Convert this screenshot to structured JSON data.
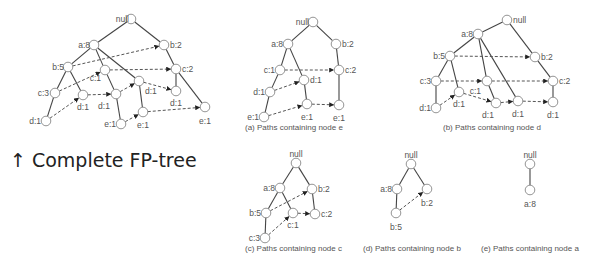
{
  "title_caption": "↑ Complete FP-tree",
  "colors": {
    "edge": "#444444",
    "link": "#555555",
    "node_stroke": "#888888",
    "text": "#555555"
  },
  "trees": [
    {
      "id": "complete",
      "caption": "",
      "nodes": [
        {
          "id": "null",
          "label": "null",
          "x": 131,
          "y": 19,
          "lx": -2,
          "ly": 0,
          "anchor": "end"
        },
        {
          "id": "a8",
          "label": "a:8",
          "x": 94,
          "y": 45,
          "lx": -4,
          "ly": 0,
          "anchor": "end"
        },
        {
          "id": "b2",
          "label": "b:2",
          "x": 164,
          "y": 45,
          "lx": 6,
          "ly": 0,
          "anchor": "start"
        },
        {
          "id": "b5",
          "label": "b:5",
          "x": 68,
          "y": 67,
          "lx": -4,
          "ly": 0,
          "anchor": "end"
        },
        {
          "id": "c1",
          "label": "c:1",
          "x": 105,
          "y": 70,
          "lx": -4,
          "ly": 8,
          "anchor": "end"
        },
        {
          "id": "c2",
          "label": "c:2",
          "x": 176,
          "y": 69,
          "lx": 6,
          "ly": 0,
          "anchor": "start"
        },
        {
          "id": "c3",
          "label": "c:3",
          "x": 55,
          "y": 93,
          "lx": -6,
          "ly": 0,
          "anchor": "end"
        },
        {
          "id": "d1a",
          "label": "d:1",
          "x": 83,
          "y": 95,
          "lx": 0,
          "ly": 12,
          "anchor": "middle"
        },
        {
          "id": "d1b",
          "label": "d:1",
          "x": 116,
          "y": 94,
          "lx": -12,
          "ly": 12,
          "anchor": "middle"
        },
        {
          "id": "d1c",
          "label": "d:1",
          "x": 139,
          "y": 81,
          "lx": 6,
          "ly": 10,
          "anchor": "start"
        },
        {
          "id": "d1d",
          "label": "d:1",
          "x": 176,
          "y": 91,
          "lx": 0,
          "ly": 12,
          "anchor": "middle"
        },
        {
          "id": "d1e",
          "label": "d:1",
          "x": 46,
          "y": 121,
          "lx": -5,
          "ly": 0,
          "anchor": "end"
        },
        {
          "id": "e1a",
          "label": "e:1",
          "x": 121,
          "y": 124,
          "lx": -5,
          "ly": 0,
          "anchor": "end"
        },
        {
          "id": "e1b",
          "label": "e:1",
          "x": 143,
          "y": 112,
          "lx": 0,
          "ly": 13,
          "anchor": "middle"
        },
        {
          "id": "e1c",
          "label": "e:1",
          "x": 205,
          "y": 107,
          "lx": 0,
          "ly": 14,
          "anchor": "middle"
        }
      ],
      "edges": [
        [
          "null",
          "a8"
        ],
        [
          "null",
          "b2"
        ],
        [
          "a8",
          "b5"
        ],
        [
          "a8",
          "c1"
        ],
        [
          "a8",
          "d1c"
        ],
        [
          "b5",
          "c3"
        ],
        [
          "b5",
          "d1a"
        ],
        [
          "c3",
          "d1e"
        ],
        [
          "c1",
          "d1b"
        ],
        [
          "d1b",
          "e1a"
        ],
        [
          "d1c",
          "e1b"
        ],
        [
          "b2",
          "c2"
        ],
        [
          "c2",
          "d1d"
        ],
        [
          "c2",
          "e1c"
        ]
      ],
      "links": [
        [
          "b5",
          "b2"
        ],
        [
          "c3",
          "c1"
        ],
        [
          "c1",
          "c2"
        ],
        [
          "d1e",
          "d1a"
        ],
        [
          "d1a",
          "d1b"
        ],
        [
          "d1b",
          "d1c"
        ],
        [
          "d1c",
          "d1d"
        ],
        [
          "e1a",
          "e1b"
        ],
        [
          "e1b",
          "e1c"
        ]
      ]
    },
    {
      "id": "a",
      "caption": "(a) Paths containing node e",
      "caption_x": 245,
      "caption_y": 130,
      "nodes": [
        {
          "id": "null",
          "label": "null",
          "x": 313,
          "y": 22,
          "lx": -4,
          "ly": 0,
          "anchor": "end"
        },
        {
          "id": "a8",
          "label": "a:8",
          "x": 288,
          "y": 44,
          "lx": -5,
          "ly": 0,
          "anchor": "end"
        },
        {
          "id": "b2",
          "label": "b:2",
          "x": 336,
          "y": 44,
          "lx": 6,
          "ly": 0,
          "anchor": "start"
        },
        {
          "id": "c1",
          "label": "c:1",
          "x": 280,
          "y": 70,
          "lx": -5,
          "ly": 0,
          "anchor": "end"
        },
        {
          "id": "c2",
          "label": "c:2",
          "x": 339,
          "y": 70,
          "lx": 6,
          "ly": 0,
          "anchor": "start"
        },
        {
          "id": "d1a",
          "label": "d:1",
          "x": 304,
          "y": 80,
          "lx": 6,
          "ly": 0,
          "anchor": "start"
        },
        {
          "id": "d1b",
          "label": "d:1",
          "x": 270,
          "y": 92,
          "lx": -5,
          "ly": 0,
          "anchor": "end"
        },
        {
          "id": "e1a",
          "label": "e:1",
          "x": 264,
          "y": 117,
          "lx": -5,
          "ly": 0,
          "anchor": "end"
        },
        {
          "id": "e1b",
          "label": "e:1",
          "x": 307,
          "y": 104,
          "lx": 0,
          "ly": 13,
          "anchor": "middle"
        },
        {
          "id": "e1c",
          "label": "e:1",
          "x": 339,
          "y": 105,
          "lx": 0,
          "ly": 13,
          "anchor": "middle"
        }
      ],
      "edges": [
        [
          "null",
          "a8"
        ],
        [
          "null",
          "b2"
        ],
        [
          "a8",
          "c1"
        ],
        [
          "a8",
          "d1a"
        ],
        [
          "c1",
          "d1b"
        ],
        [
          "d1b",
          "e1a"
        ],
        [
          "d1a",
          "e1b"
        ],
        [
          "b2",
          "c2"
        ],
        [
          "c2",
          "e1c"
        ]
      ],
      "links": [
        [
          "c1",
          "c2"
        ],
        [
          "e1a",
          "e1b"
        ],
        [
          "e1b",
          "e1c"
        ],
        [
          "d1b",
          "d1a"
        ]
      ]
    },
    {
      "id": "b",
      "caption": "(b) Paths containing node d",
      "caption_x": 443,
      "caption_y": 130,
      "nodes": [
        {
          "id": "null",
          "label": "null",
          "x": 507,
          "y": 20,
          "lx": 6,
          "ly": 0,
          "anchor": "start"
        },
        {
          "id": "a8",
          "label": "a:8",
          "x": 478,
          "y": 34,
          "lx": -5,
          "ly": 0,
          "anchor": "end"
        },
        {
          "id": "b5",
          "label": "b:5",
          "x": 450,
          "y": 56,
          "lx": -5,
          "ly": 0,
          "anchor": "end"
        },
        {
          "id": "b2",
          "label": "b:2",
          "x": 535,
          "y": 57,
          "lx": 6,
          "ly": 0,
          "anchor": "start"
        },
        {
          "id": "c3",
          "label": "c:3",
          "x": 436,
          "y": 81,
          "lx": -5,
          "ly": 0,
          "anchor": "end"
        },
        {
          "id": "c1",
          "label": "c:1",
          "x": 487,
          "y": 81,
          "lx": -6,
          "ly": 10,
          "anchor": "end"
        },
        {
          "id": "c2",
          "label": "c:2",
          "x": 553,
          "y": 81,
          "lx": 6,
          "ly": 0,
          "anchor": "start"
        },
        {
          "id": "d1a",
          "label": "d:1",
          "x": 436,
          "y": 108,
          "lx": -5,
          "ly": 0,
          "anchor": "end"
        },
        {
          "id": "d1b",
          "label": "d:1",
          "x": 459,
          "y": 92,
          "lx": 0,
          "ly": 12,
          "anchor": "middle"
        },
        {
          "id": "d1c",
          "label": "d:1",
          "x": 496,
          "y": 103,
          "lx": -8,
          "ly": 12,
          "anchor": "middle"
        },
        {
          "id": "d1d",
          "label": "d:1",
          "x": 518,
          "y": 101,
          "lx": 0,
          "ly": 13,
          "anchor": "middle"
        },
        {
          "id": "d1e",
          "label": "d:1",
          "x": 553,
          "y": 102,
          "lx": 0,
          "ly": 13,
          "anchor": "middle"
        }
      ],
      "edges": [
        [
          "null",
          "a8"
        ],
        [
          "null",
          "b2"
        ],
        [
          "a8",
          "b5"
        ],
        [
          "a8",
          "c1"
        ],
        [
          "a8",
          "d1d"
        ],
        [
          "b5",
          "c3"
        ],
        [
          "b5",
          "d1b"
        ],
        [
          "c3",
          "d1a"
        ],
        [
          "c1",
          "d1c"
        ],
        [
          "b2",
          "c2"
        ],
        [
          "c2",
          "d1e"
        ]
      ],
      "links": [
        [
          "b5",
          "b2"
        ],
        [
          "c3",
          "c1"
        ],
        [
          "c1",
          "c2"
        ],
        [
          "d1a",
          "d1b"
        ],
        [
          "d1b",
          "d1c"
        ],
        [
          "d1c",
          "d1d"
        ],
        [
          "d1d",
          "d1e"
        ]
      ]
    },
    {
      "id": "c",
      "caption": "(c) Paths containing node c",
      "caption_x": 245,
      "caption_y": 251,
      "nodes": [
        {
          "id": "null",
          "label": "null",
          "x": 296,
          "y": 163,
          "lx": 0,
          "ly": -9,
          "anchor": "middle"
        },
        {
          "id": "a8",
          "label": "a:8",
          "x": 280,
          "y": 188,
          "lx": -5,
          "ly": 0,
          "anchor": "end"
        },
        {
          "id": "b2",
          "label": "b:2",
          "x": 312,
          "y": 189,
          "lx": 6,
          "ly": 0,
          "anchor": "start"
        },
        {
          "id": "b5",
          "label": "b:5",
          "x": 266,
          "y": 213,
          "lx": -5,
          "ly": 0,
          "anchor": "end"
        },
        {
          "id": "c1",
          "label": "c:1",
          "x": 293,
          "y": 213,
          "lx": 0,
          "ly": 12,
          "anchor": "middle"
        },
        {
          "id": "c2",
          "label": "c:2",
          "x": 315,
          "y": 214,
          "lx": 6,
          "ly": 0,
          "anchor": "start"
        },
        {
          "id": "c3",
          "label": "c:3",
          "x": 265,
          "y": 238,
          "lx": -5,
          "ly": 0,
          "anchor": "end"
        }
      ],
      "edges": [
        [
          "null",
          "a8"
        ],
        [
          "null",
          "b2"
        ],
        [
          "a8",
          "b5"
        ],
        [
          "a8",
          "c1"
        ],
        [
          "b5",
          "c3"
        ],
        [
          "b2",
          "c2"
        ]
      ],
      "links": [
        [
          "b5",
          "b2"
        ],
        [
          "c3",
          "c1"
        ],
        [
          "c1",
          "c2"
        ]
      ]
    },
    {
      "id": "d",
      "caption": "(d) Paths containing node b",
      "caption_x": 363,
      "caption_y": 251,
      "nodes": [
        {
          "id": "null",
          "label": "null",
          "x": 411,
          "y": 164,
          "lx": 0,
          "ly": -9,
          "anchor": "middle"
        },
        {
          "id": "a8",
          "label": "a:8",
          "x": 397,
          "y": 189,
          "lx": -5,
          "ly": 0,
          "anchor": "end"
        },
        {
          "id": "b2",
          "label": "b:2",
          "x": 427,
          "y": 189,
          "lx": 0,
          "ly": 14,
          "anchor": "middle"
        },
        {
          "id": "b5",
          "label": "b:5",
          "x": 396,
          "y": 213,
          "lx": 0,
          "ly": 14,
          "anchor": "middle"
        }
      ],
      "edges": [
        [
          "null",
          "a8"
        ],
        [
          "null",
          "b2"
        ],
        [
          "a8",
          "b5"
        ]
      ],
      "links": [
        [
          "b5",
          "b2"
        ]
      ]
    },
    {
      "id": "e",
      "caption": "(e) Paths containing node a",
      "caption_x": 481,
      "caption_y": 251,
      "nodes": [
        {
          "id": "null",
          "label": "null",
          "x": 530,
          "y": 164,
          "lx": 0,
          "ly": -9,
          "anchor": "middle"
        },
        {
          "id": "a8",
          "label": "a:8",
          "x": 530,
          "y": 190,
          "lx": 0,
          "ly": 14,
          "anchor": "middle"
        }
      ],
      "edges": [
        [
          "null",
          "a8"
        ]
      ],
      "links": []
    }
  ]
}
